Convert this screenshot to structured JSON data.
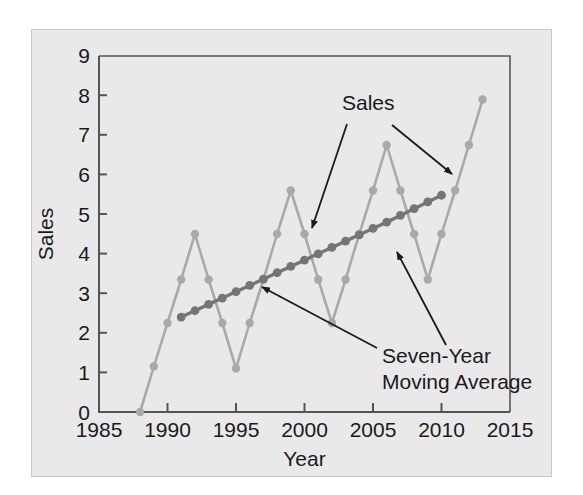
{
  "figure": {
    "panel_background": "#e9e9e9",
    "page_background": "#ffffff",
    "panel_border": "#c9c9c9"
  },
  "chart_data": {
    "type": "line",
    "title": "",
    "xlabel": "Year",
    "ylabel": "Sales",
    "xlim": [
      1985,
      2015
    ],
    "ylim": [
      0,
      9
    ],
    "xticks": [
      1985,
      1990,
      1995,
      2000,
      2005,
      2010,
      2015
    ],
    "xtick_labels": [
      "1985",
      "1990",
      "1995",
      "2000",
      "2005",
      "2010",
      "2015"
    ],
    "yticks": [
      0,
      1,
      2,
      3,
      4,
      5,
      6,
      7,
      8,
      9
    ],
    "ytick_labels": [
      "0",
      "1",
      "2",
      "3",
      "4",
      "5",
      "6",
      "7",
      "8",
      "9"
    ],
    "grid": false,
    "legend": "none",
    "series": [
      {
        "name": "Sales",
        "color": "#a9a9a9",
        "marker": "circle",
        "x": [
          1988,
          1989,
          1990,
          1991,
          1992,
          1993,
          1994,
          1995,
          1996,
          1997,
          1998,
          1999,
          2000,
          2001,
          2002,
          2003,
          2004,
          2005,
          2006,
          2007,
          2008,
          2009,
          2010,
          2011,
          2012,
          2013
        ],
        "values": [
          0.0,
          1.15,
          2.25,
          3.35,
          4.5,
          3.35,
          2.25,
          1.1,
          2.25,
          3.35,
          4.5,
          5.6,
          4.5,
          3.35,
          2.25,
          3.35,
          4.5,
          5.6,
          6.75,
          5.6,
          4.5,
          3.35,
          4.5,
          5.6,
          6.75,
          7.9
        ]
      },
      {
        "name": "Seven-Year Moving Average",
        "color": "#757575",
        "marker": "circle",
        "x": [
          1991,
          1992,
          1993,
          1994,
          1995,
          1996,
          1997,
          1998,
          1999,
          2000,
          2001,
          2002,
          2003,
          2004,
          2005,
          2006,
          2007,
          2008,
          2009,
          2010
        ],
        "values": [
          2.4,
          2.56,
          2.72,
          2.88,
          3.04,
          3.2,
          3.36,
          3.52,
          3.68,
          3.84,
          4.0,
          4.16,
          4.32,
          4.48,
          4.64,
          4.8,
          4.97,
          5.14,
          5.31,
          5.48
        ]
      }
    ],
    "annotations": [
      {
        "name": "sales-label",
        "text": "Sales",
        "x": 1999.5,
        "y": 8.05
      },
      {
        "name": "moving-average-label-line1",
        "text": "Seven-Year",
        "x": 2007.5,
        "y": 1.6
      },
      {
        "name": "moving-average-label-line2",
        "text": "Moving Average",
        "x": 2008.5,
        "y": 0.85
      }
    ]
  }
}
